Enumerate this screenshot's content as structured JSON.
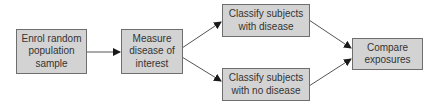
{
  "diagram": {
    "nodes": [
      {
        "id": "enrol",
        "label": "Enrol random\npopulation\nsample"
      },
      {
        "id": "measure",
        "label": "Measure\ndisease of\ninterest"
      },
      {
        "id": "with_disease",
        "label": "Classify subjects\nwith disease"
      },
      {
        "id": "no_disease",
        "label": "Classify subjects\nwith no disease"
      },
      {
        "id": "compare",
        "label": "Compare\nexposures"
      }
    ],
    "edges": [
      {
        "from": "enrol",
        "to": "measure"
      },
      {
        "from": "measure",
        "to": "with_disease"
      },
      {
        "from": "measure",
        "to": "no_disease"
      },
      {
        "from": "with_disease",
        "to": "compare"
      },
      {
        "from": "no_disease",
        "to": "compare"
      }
    ],
    "colors": {
      "box_fill": "#d3d3d3",
      "box_border": "#6e6e6e",
      "arrow": "#555555",
      "arrowhead": "#1a1a1a"
    }
  }
}
